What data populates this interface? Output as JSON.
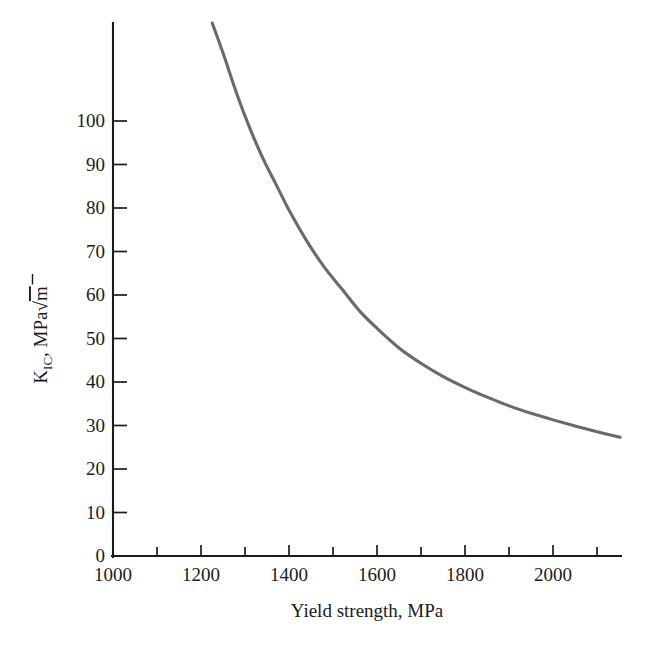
{
  "chart_data": {
    "type": "line",
    "title": "",
    "subtitle": "",
    "xlabel": "Yield strength, MPa",
    "ylabel": "K_IC, MPa√m",
    "ylabel_parts": {
      "base": "K",
      "subscript": "IC",
      "comma": ", MPa",
      "radical": "√",
      "radicand": "m"
    },
    "xlim": [
      1000,
      2152
    ],
    "ylim": [
      0,
      122
    ],
    "grid": false,
    "legend": null,
    "x_major_ticks": [
      1000,
      1200,
      1400,
      1600,
      1800,
      2000
    ],
    "x_major_tick_labels": [
      "1000",
      "1200",
      "1400",
      "1600",
      "1800",
      "2000"
    ],
    "x_minor_ticks": [
      1100,
      1300,
      1500,
      1700,
      1900,
      2100
    ],
    "y_major_ticks": [
      0,
      10,
      20,
      30,
      40,
      50,
      60,
      70,
      80,
      90,
      100
    ],
    "y_major_tick_labels": [
      "0",
      "10",
      "20",
      "30",
      "40",
      "50",
      "60",
      "70",
      "80",
      "90",
      "100"
    ],
    "series": [
      {
        "name": "fracture toughness vs yield strength",
        "color": "#6a6a6a",
        "x": [
          1225,
          1250,
          1280,
          1310,
          1340,
          1370,
          1400,
          1440,
          1480,
          1520,
          1560,
          1600,
          1650,
          1700,
          1750,
          1800,
          1850,
          1900,
          1950,
          2000,
          2050,
          2100,
          2150
        ],
        "y": [
          122,
          115,
          106,
          98,
          91,
          85,
          79,
          72,
          66,
          61,
          56,
          52,
          47.5,
          44,
          41,
          38.5,
          36.3,
          34.3,
          32.6,
          31.1,
          29.7,
          28.4,
          27.2
        ]
      }
    ],
    "annotations": []
  },
  "axes": {
    "x_axis_name": "x-axis",
    "y_axis_name": "y-axis"
  },
  "style": {
    "curve_color": "#6a6a6a",
    "axis_color": "#1b1b1b",
    "background": "#ffffff"
  }
}
